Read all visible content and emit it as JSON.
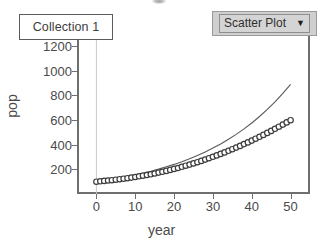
{
  "collection": {
    "label": "Collection 1"
  },
  "plot_type_dropdown": {
    "label": "Scatter Plot",
    "caret": "▼",
    "icon": "chevron-down-icon"
  },
  "chart_data": {
    "type": "scatter",
    "title": "",
    "xlabel": "year",
    "ylabel": "pop",
    "xlim": [
      -5,
      55
    ],
    "ylim": [
      0,
      1280
    ],
    "xticks": [
      0,
      10,
      20,
      30,
      40,
      50
    ],
    "yticks": [
      200,
      400,
      600,
      800,
      1000,
      1200
    ],
    "grid": false,
    "vertical_gridline_at_x": 0,
    "legend": "none",
    "series": [
      {
        "name": "observed pop",
        "render": "scatter",
        "marker": "open-circle",
        "color": "#3d3d3d",
        "x": [
          0,
          1,
          2,
          3,
          4,
          5,
          6,
          7,
          8,
          9,
          10,
          11,
          12,
          13,
          14,
          15,
          16,
          17,
          18,
          19,
          20,
          21,
          22,
          23,
          24,
          25,
          26,
          27,
          28,
          29,
          30,
          31,
          32,
          33,
          34,
          35,
          36,
          37,
          38,
          39,
          40,
          41,
          42,
          43,
          44,
          45,
          46,
          47,
          48,
          49,
          50
        ],
        "values": [
          100,
          103,
          106,
          109,
          112,
          116,
          120,
          124,
          128,
          133,
          138,
          143,
          148,
          154,
          160,
          166,
          173,
          180,
          187,
          195,
          203,
          211,
          220,
          229,
          238,
          248,
          258,
          268,
          279,
          290,
          301,
          313,
          325,
          337,
          350,
          363,
          376,
          390,
          404,
          418,
          433,
          448,
          463,
          479,
          495,
          511,
          528,
          545,
          562,
          580,
          598
        ]
      },
      {
        "name": "exponential model",
        "render": "line",
        "color": "#5a5a5a",
        "x": [
          0,
          2,
          4,
          6,
          8,
          10,
          12,
          14,
          16,
          18,
          20,
          22,
          24,
          26,
          28,
          30,
          32,
          34,
          36,
          38,
          40,
          42,
          44,
          46,
          48,
          50
        ],
        "values": [
          100,
          109,
          119,
          130,
          142,
          155,
          169,
          185,
          202,
          220,
          240,
          262,
          286,
          312,
          341,
          372,
          406,
          443,
          483,
          527,
          575,
          628,
          685,
          747,
          815,
          889
        ]
      }
    ]
  }
}
